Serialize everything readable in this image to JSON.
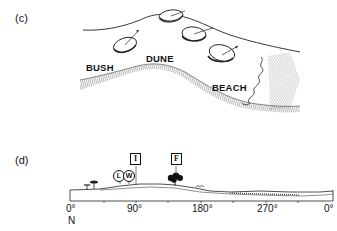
{
  "panel_c": {
    "label": "(c)",
    "zones": {
      "bush": "BUSH",
      "dune": "DUNE",
      "beach": "BEACH"
    },
    "compass_discs": 4
  },
  "panel_d": {
    "label": "(d)",
    "markers": {
      "i": "I",
      "f": "F",
      "l": "L",
      "w": "W"
    },
    "axis": {
      "ticks": [
        "0°",
        "90°",
        "180°",
        "270°",
        "0°"
      ],
      "north_label": "N"
    }
  }
}
